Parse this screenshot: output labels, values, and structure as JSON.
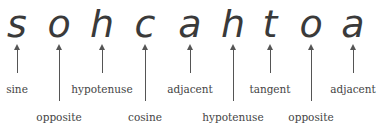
{
  "mnemonic": "sohcahtoa",
  "items": [
    {
      "letter": "s",
      "label": "sine",
      "x": 17,
      "row": "short"
    },
    {
      "letter": "o",
      "label": "opposite",
      "x": 59,
      "row": "long"
    },
    {
      "letter": "h",
      "label": "hypotenuse",
      "x": 102,
      "row": "short"
    },
    {
      "letter": "c",
      "label": "cosine",
      "x": 145,
      "row": "long"
    },
    {
      "letter": "a",
      "label": "adjacent",
      "x": 190,
      "row": "short"
    },
    {
      "letter": "h",
      "label": "hypotenuse",
      "x": 233,
      "row": "long"
    },
    {
      "letter": "t",
      "label": "tangent",
      "x": 270,
      "row": "short"
    },
    {
      "letter": "o",
      "label": "opposite",
      "x": 311,
      "row": "long"
    },
    {
      "letter": "a",
      "label": "adjacent",
      "x": 353,
      "row": "short"
    }
  ]
}
